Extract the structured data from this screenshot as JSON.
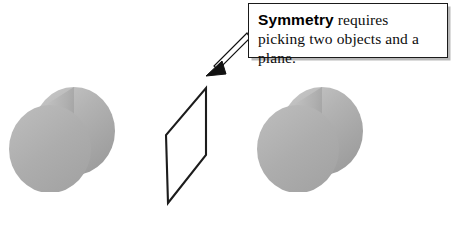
{
  "figure": {
    "background_color": "#ffffff",
    "callout": {
      "term": "Symmetry",
      "body": " requires picking two objects and a plane.",
      "full_text": "Symmetry requires picking two objects and a plane.",
      "border_color": "#1a1a1a",
      "shadow_color": "#b9b9b9",
      "text_color": "#0d0d0d"
    },
    "pointer": {
      "name": "callout-arrow",
      "description": "thin outlined arrow from callout box to top corner of plane",
      "from": "callout-box-left-edge",
      "to": "plane-top-corner",
      "fill_color": "#ffffff",
      "stroke_color": "#111111"
    },
    "plane": {
      "label": "symmetry-plane",
      "shape": "parallelogram",
      "stroke_color": "#1c1c1c",
      "fill_color": "#ffffff",
      "points": "206,88 206,155 168,203 166,135"
    },
    "objects": [
      {
        "label": "left-cylinder",
        "side": "left",
        "front_face_color": "#adadad",
        "body_color": "#b4b4b4",
        "highlight_color": "#c9c9c9",
        "shade_color": "#9d9d9d"
      },
      {
        "label": "right-cylinder",
        "side": "right",
        "front_face_color": "#adadad",
        "body_color": "#b4b4b4",
        "highlight_color": "#c9c9c9",
        "shade_color": "#9d9d9d"
      }
    ]
  }
}
